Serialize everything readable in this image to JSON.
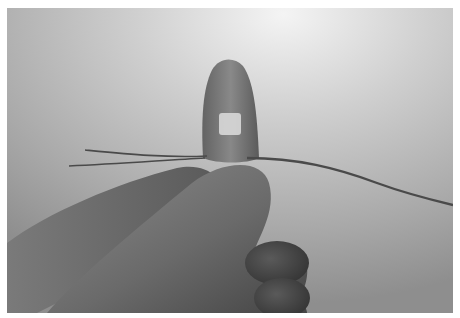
{
  "image": {
    "description": "Grayscale photograph of a hand holding a small translucent dome-shaped object between thumb and fingers, with thin wires extending left and right against a bright background",
    "colors": {
      "background_light": "#e6e6e6",
      "background_mid": "#b8b8b8",
      "background_dark": "#8c8c8c",
      "hand_light": "#8a8a8a",
      "hand_dark": "#3e3e3e",
      "object_body": "#6e6e6e",
      "object_highlight": "#d6d6d6",
      "wire": "#4a4a4a",
      "border": "#ffffff"
    }
  }
}
